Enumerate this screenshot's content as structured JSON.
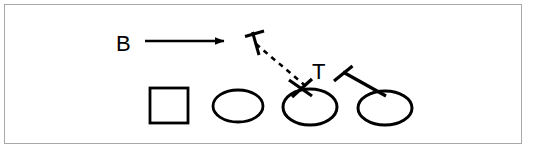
{
  "figure": {
    "kind": "line-diagram",
    "background_color": "#ffffff",
    "stroke_color": "#000000",
    "frame": {
      "border_color": "#a8a8a8",
      "border_width": 1,
      "x": 4,
      "y": 4,
      "width": 518,
      "height": 140
    },
    "labels": [
      {
        "id": "label-b",
        "text": "B",
        "x": 116,
        "y": 51,
        "font_size": 22
      },
      {
        "id": "label-t",
        "text": "T",
        "x": 312,
        "y": 79,
        "font_size": 22
      }
    ],
    "arrow": {
      "id": "arrow-b",
      "name": "b-direction-arrow",
      "x1": 145,
      "y1": 41,
      "x2": 232,
      "y2": 41,
      "stroke_width": 2.6,
      "head_length": 12,
      "head_width": 9
    },
    "dashed_path": {
      "id": "trajectory-dashed",
      "name": "dashed-trajectory-line",
      "x1": 255,
      "y1": 43,
      "x2": 308,
      "y2": 87,
      "stroke_width": 2.6,
      "dash_pattern": "5 5"
    },
    "mallets": [
      {
        "id": "mallet-upper-left",
        "name": "mallet-upper-left",
        "shaft": {
          "x1": 252,
          "y1": 31,
          "x2": 259,
          "y2": 54
        },
        "head": {
          "x1": 245,
          "y1": 36,
          "x2": 264,
          "y2": 31
        },
        "stroke_width": 3
      },
      {
        "id": "mallet-center",
        "name": "mallet-center",
        "shaft": {
          "x1": 289,
          "y1": 80,
          "x2": 311,
          "y2": 95
        },
        "head": {
          "x1": 293,
          "y1": 96,
          "x2": 311,
          "y2": 79
        },
        "stroke_width": 3.2
      },
      {
        "id": "mallet-right",
        "name": "mallet-right",
        "shaft": {
          "x1": 342,
          "y1": 71,
          "x2": 384,
          "y2": 95
        },
        "head": {
          "x1": 334,
          "y1": 80,
          "x2": 352,
          "y2": 66
        },
        "stroke_width": 3.2
      }
    ],
    "square": {
      "id": "shape-square",
      "name": "square-marker",
      "x": 150,
      "y": 88,
      "width": 38,
      "height": 35,
      "stroke_width": 2.8
    },
    "ellipses": [
      {
        "id": "shape-ellipse-1",
        "name": "ellipse-marker-1",
        "cx": 238,
        "cy": 106,
        "rx": 25,
        "ry": 16,
        "stroke_width": 2.8
      },
      {
        "id": "shape-ellipse-2",
        "name": "ellipse-marker-2",
        "cx": 310,
        "cy": 107,
        "rx": 27,
        "ry": 18,
        "stroke_width": 3.0
      },
      {
        "id": "shape-ellipse-3",
        "name": "ellipse-marker-3",
        "cx": 385,
        "cy": 108,
        "rx": 27,
        "ry": 17,
        "stroke_width": 3.0
      }
    ]
  }
}
